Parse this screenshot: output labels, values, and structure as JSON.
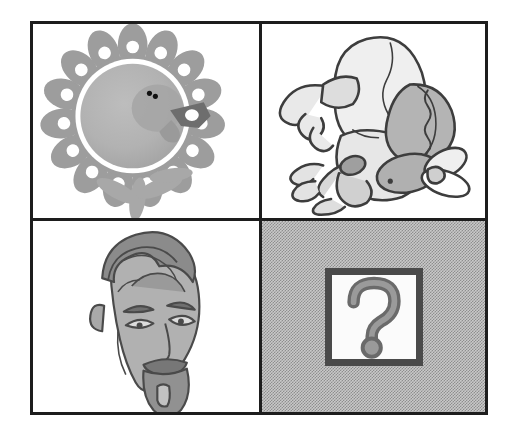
{
  "puzzle": {
    "type": "visual-analogy-matrix",
    "rows": 2,
    "columns": 2,
    "frame_color": "#1d1d1d",
    "panel_background": "#ffffff",
    "answer_cell_background": "#a8a8a8"
  },
  "cells": [
    {
      "position": "top-left",
      "icon_name": "turkey-fanned-tail-illustration",
      "description": "Gray cartoon turkey facing right with a fanned scalloped tail of feathers dotted with white circles, round body, two small eyes, a dark beak and wattle, and leaf-shaped feet",
      "background": "#ffffff",
      "alt": "Turkey with fanned tail"
    },
    {
      "position": "top-right",
      "icon_name": "cartoon-bird-bending-illustration",
      "description": "Line-art cartoon bird with a large pale egg-shaped body bending forward, a curled wing at the left, shaded tail feathers at the right, clawed feet and a downturned head",
      "background": "#ffffff",
      "alt": "Cartoon bird bending forward"
    },
    {
      "position": "bottom-left",
      "icon_name": "mans-face-goatee-illustration",
      "description": "Gray three-quarter view drawing of a man's face with swept-back hair, heavy eyebrows, narrow eyes, a mustache and a pointed goatee",
      "background": "#ffffff",
      "alt": "Man's face with goatee"
    },
    {
      "position": "bottom-right",
      "icon_name": "question-mark-box",
      "description": "Gray dithered panel containing a white square with a thick dark border enclosing a large gray question mark",
      "background": "#a8a8a8",
      "question_mark": "?",
      "box_border_color": "#4a4a4a",
      "box_fill": "#fbfbfb",
      "alt": "Unknown answer placeholder"
    }
  ]
}
